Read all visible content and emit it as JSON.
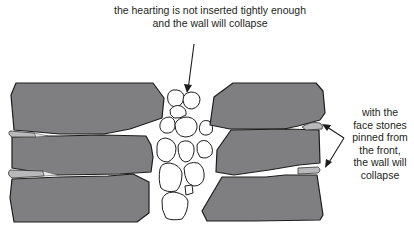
{
  "annotations": {
    "hearting_note": {
      "line1": "the hearting is not inserted tightly enough",
      "line2": "and the wall will collapse"
    },
    "face_note": {
      "line1": "with the",
      "line2": "face stones",
      "line3": "pinned from",
      "line4": "the front,",
      "line5": "the wall will",
      "line6": "collapse"
    }
  },
  "colors": {
    "face_stone": "#7f7f81",
    "pin_stone": "#b9b9bb",
    "hearting_stone": "#ffffff",
    "outline": "#1d1d1d",
    "text": "#231f20"
  },
  "structure": {
    "left_face_stones": 3,
    "right_face_stones": 3,
    "left_pins": 2,
    "right_pins": 2
  }
}
